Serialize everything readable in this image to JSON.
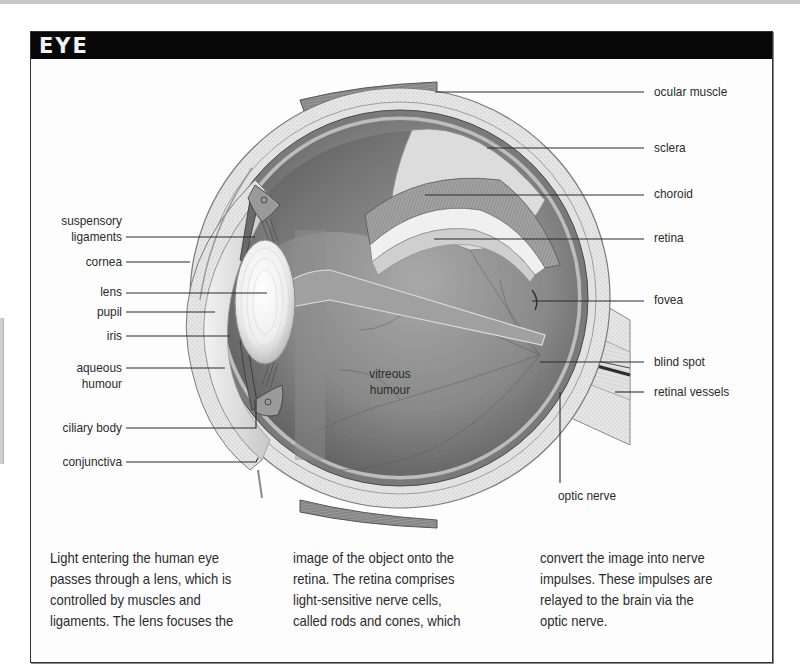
{
  "panel": {
    "title": "EYE"
  },
  "labels": {
    "left": [
      {
        "id": "suspensory-ligaments",
        "lines": [
          "suspensory",
          "ligaments"
        ]
      },
      {
        "id": "cornea",
        "lines": [
          "cornea"
        ]
      },
      {
        "id": "lens",
        "lines": [
          "lens"
        ]
      },
      {
        "id": "pupil",
        "lines": [
          "pupil"
        ]
      },
      {
        "id": "iris",
        "lines": [
          "iris"
        ]
      },
      {
        "id": "aqueous-humour",
        "lines": [
          "aqueous",
          "humour"
        ]
      },
      {
        "id": "ciliary-body",
        "lines": [
          "ciliary body"
        ]
      },
      {
        "id": "conjunctiva",
        "lines": [
          "conjunctiva"
        ]
      }
    ],
    "right": [
      {
        "id": "ocular-muscle",
        "lines": [
          "ocular muscle"
        ]
      },
      {
        "id": "sclera",
        "lines": [
          "sclera"
        ]
      },
      {
        "id": "choroid",
        "lines": [
          "choroid"
        ]
      },
      {
        "id": "retina",
        "lines": [
          "retina"
        ]
      },
      {
        "id": "fovea",
        "lines": [
          "fovea"
        ]
      },
      {
        "id": "blind-spot",
        "lines": [
          "blind spot"
        ]
      },
      {
        "id": "retinal-vessels",
        "lines": [
          "retinal vessels"
        ]
      }
    ],
    "bottom": [
      {
        "id": "optic-nerve",
        "lines": [
          "optic nerve"
        ]
      }
    ],
    "inner": [
      {
        "id": "vitreous-humour",
        "lines": [
          "vitreous",
          "humour"
        ]
      }
    ]
  },
  "caption": {
    "columns": [
      [
        "Light entering the human eye",
        "passes through a lens, which is",
        "controlled by muscles and",
        "ligaments. The lens focuses the"
      ],
      [
        "image of the object onto the",
        "retina. The retina comprises",
        "light-sensitive nerve cells,",
        "called rods and cones, which"
      ],
      [
        "convert the image into nerve",
        "impulses. These impulses are",
        "relayed to the brain via the",
        "optic nerve."
      ]
    ]
  }
}
